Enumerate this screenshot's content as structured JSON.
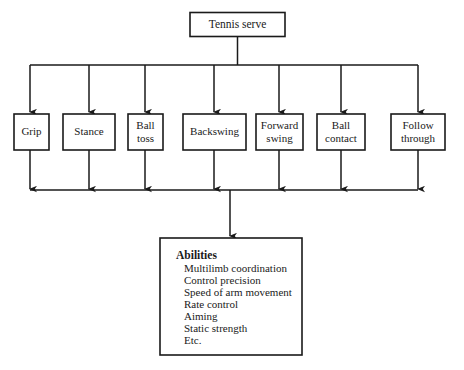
{
  "diagram": {
    "type": "hierarchical-flow-chart",
    "root": {
      "label": "Tennis serve"
    },
    "stages": [
      {
        "label_line1": "Grip",
        "label_line2": ""
      },
      {
        "label_line1": "Stance",
        "label_line2": ""
      },
      {
        "label_line1": "Ball",
        "label_line2": "toss"
      },
      {
        "label_line1": "Backswing",
        "label_line2": ""
      },
      {
        "label_line1": "Forward",
        "label_line2": "swing"
      },
      {
        "label_line1": "Ball",
        "label_line2": "contact"
      },
      {
        "label_line1": "Follow",
        "label_line2": "through"
      }
    ],
    "outcome": {
      "title": "Abilities",
      "items": [
        "Multilimb coordination",
        "Control precision",
        "Speed of arm movement",
        "Rate control",
        "Aiming",
        "Static strength",
        "Etc."
      ]
    },
    "colors": {
      "stroke": "#1a1a1a",
      "fill": "#ffffff",
      "background": "#ffffff"
    }
  }
}
